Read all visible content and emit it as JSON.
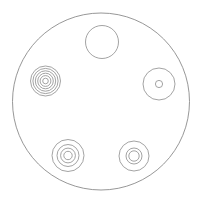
{
  "canvas": {
    "width": 201,
    "height": 208,
    "background_color": "#ffffff",
    "stroke_color": "#8b8b8b",
    "stroke_width": 0.8,
    "fill": "none",
    "title": "Circular plate with five concentric-ring features"
  },
  "chart_data": {
    "type": "diagram",
    "title": "Circular plate with five concentric-ring features",
    "subtitle": "",
    "xlabel": "",
    "ylabel": "",
    "grid": false,
    "legend_position": "none",
    "units": "pixels",
    "xlim": [
      0,
      201
    ],
    "ylim": [
      0,
      208
    ],
    "plate": {
      "name": "outer-plate-boundary",
      "shape": "circle",
      "cx": 101,
      "cy": 101.5,
      "r": 88.5,
      "stroke": "#8b8b8b",
      "fill": "none"
    },
    "features": [
      {
        "name": "top-plain-hole",
        "shape": "concentric-circles",
        "cx": 102,
        "cy": 42,
        "ring_count": 1,
        "radii": [
          16.5
        ],
        "position_label": "top-center"
      },
      {
        "name": "left-multi-ring-target",
        "shape": "concentric-circles",
        "cx": 45.5,
        "cy": 81,
        "ring_count": 6,
        "radii": [
          15.0,
          12.6,
          10.2,
          7.8,
          5.4,
          2.8
        ],
        "position_label": "left"
      },
      {
        "name": "right-hole-with-pin",
        "shape": "concentric-circles",
        "cx": 159,
        "cy": 84,
        "ring_count": 2,
        "radii": [
          16.0,
          3.6
        ],
        "position_label": "right"
      },
      {
        "name": "bottom-left-ring-target",
        "shape": "concentric-circles",
        "cx": 68,
        "cy": 155.5,
        "ring_count": 4,
        "radii": [
          16.0,
          11.0,
          7.4,
          4.2
        ],
        "position_label": "bottom-left"
      },
      {
        "name": "bottom-right-ring-target",
        "shape": "concentric-circles",
        "cx": 134,
        "cy": 156,
        "ring_count": 3,
        "radii": [
          15.0,
          8.0,
          5.2
        ],
        "position_label": "bottom-right"
      }
    ]
  }
}
